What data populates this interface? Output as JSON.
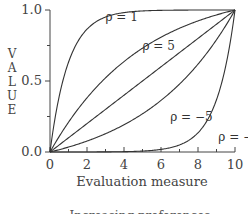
{
  "chart_data": {
    "type": "line",
    "title": "",
    "xlabel": "Evaluation measure",
    "ylabel": "VALUE",
    "xlim": [
      0,
      10
    ],
    "ylim": [
      0.0,
      1.0
    ],
    "x_ticks": [
      0,
      2,
      4,
      6,
      8,
      10
    ],
    "x_tick_labels": [
      "0",
      "2",
      "4",
      "6",
      "8",
      "10"
    ],
    "x_minor_ticks": [
      1,
      3,
      5,
      7,
      9
    ],
    "y_ticks": [
      0.0,
      0.5,
      1.0
    ],
    "y_tick_labels": [
      "0.0",
      "0.5",
      "1.0"
    ],
    "y_minor_ticks": [
      0.25,
      0.75
    ],
    "grid": false,
    "series": [
      {
        "name": "rho = 1",
        "label": "ρ = 1",
        "rho": 1,
        "label_at": [
          3.0,
          0.92
        ]
      },
      {
        "name": "rho = 5",
        "label": "ρ = 5",
        "rho": 5,
        "label_at": [
          5.0,
          0.72
        ]
      },
      {
        "name": "linear",
        "label": "",
        "rho": null,
        "label_at": null
      },
      {
        "name": "rho = -5",
        "label": "ρ = −5",
        "rho": -5,
        "label_at": [
          6.5,
          0.22
        ]
      },
      {
        "name": "rho = -1",
        "label": "ρ = −1",
        "rho": -1,
        "label_at": [
          9.1,
          0.08
        ]
      }
    ],
    "footer": "Increasing preferences"
  }
}
